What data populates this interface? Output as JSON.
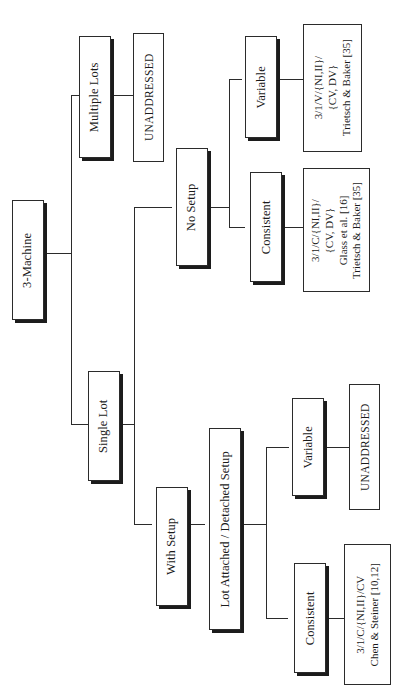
{
  "diagram": {
    "orientation": "rotated-90-ccw",
    "line_color": "#2b2b2b",
    "box_fill": "#ffffff",
    "shadow_color": "#1c1c1c"
  },
  "nodes": {
    "root": {
      "label": "3-Machine"
    },
    "multiple_lots": {
      "label": "Multiple Lots"
    },
    "single_lot": {
      "label": "Single Lot"
    },
    "no_setup": {
      "label": "No Setup"
    },
    "with_setup": {
      "label": "With Setup"
    },
    "lot_attached": {
      "label": "Lot Attached / Detached Setup"
    },
    "variable_top": {
      "label": "Variable"
    },
    "consistent_top": {
      "label": "Consistent"
    },
    "variable_bottom": {
      "label": "Variable"
    },
    "consistent_bottom": {
      "label": "Consistent"
    }
  },
  "leaves": {
    "unaddressed_multiple_lots": {
      "label": "UNADDRESSED"
    },
    "unaddressed_variable_setup": {
      "label": "UNADDRESSED"
    },
    "variable_no_setup": {
      "label": "3/1/V/{NI,II}/\n{CV, DV}\nTrietsch & Baker [35]"
    },
    "consistent_no_setup": {
      "label": "3/1/C/{NI,II}/\n{CV, DV}\nGlass et al. [16]\nTrietsch & Baker [35]"
    },
    "consistent_setup": {
      "label": "3/1/C/{NI,II}/CV\nChen & Steiner [10,12]"
    }
  }
}
